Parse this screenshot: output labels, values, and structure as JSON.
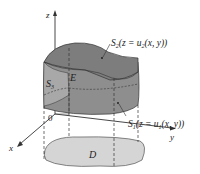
{
  "diagram": {
    "type": "3d-region-type1",
    "labels": {
      "z_axis": "z",
      "x_axis": "x",
      "y_axis": "y",
      "origin": "0",
      "region": "E",
      "domain": "D",
      "side_surface": "S",
      "side_surface_sub": "3",
      "top_surface": "S",
      "top_surface_sub": "2",
      "top_surface_eq_pre": "(z = u",
      "top_surface_eq_sub": "2",
      "top_surface_eq_post": "(x, y))",
      "bottom_surface": "S",
      "bottom_surface_sub": "1",
      "bottom_surface_eq_pre": "(z = u",
      "bottom_surface_eq_sub": "1",
      "bottom_surface_eq_post": "(x, y))"
    },
    "colors": {
      "top_surface": "#8c8c8c",
      "side_surface": "#a6a6a6",
      "bottom_region": "#cfcfcf",
      "domain_fill": "#d9d9d9",
      "lines": "#333333"
    }
  }
}
